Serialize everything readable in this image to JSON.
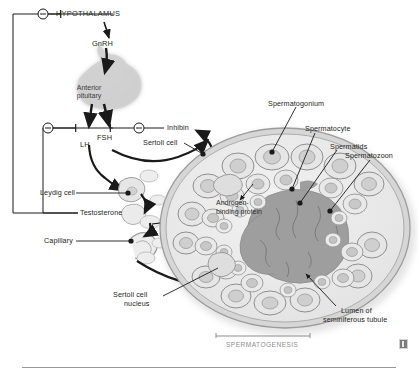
{
  "figure": {
    "title_region": "Hypothalamic-pituitary-testicular axis and seminiferous tubule histology",
    "bracket_label": "SPERMATOGENESIS"
  },
  "axis": {
    "hypothalamus": "HYPOTHALAMUS",
    "gnrh": "GnRH",
    "anterior_pituitary_line1": "Anterior",
    "anterior_pituitary_line2": "pituitary",
    "lh": "LH",
    "fsh": "FSH",
    "inhibin": "Inhibin",
    "feedback_sign": "–"
  },
  "left_labels": [
    {
      "name": "leydig-cell",
      "text": "Leydig cell"
    },
    {
      "name": "testosterone",
      "text": "Testosterone"
    },
    {
      "name": "capillary",
      "text": "Capillary"
    },
    {
      "name": "sertoli-cell-nucleus-line1",
      "text": "Sertoli cell"
    },
    {
      "name": "sertoli-cell-nucleus-line2",
      "text": "nucleus"
    }
  ],
  "tubule_labels": {
    "sertoli_cell": "Sertoli cell",
    "spermatogonium": "Spermatogonium",
    "spermatocyte": "Spermatocyte",
    "spermatids": "Spermatids",
    "spermatozoon": "Spermatozoon",
    "androgen_binding_line1": "Androgen-",
    "androgen_binding_line2": "binding protein",
    "lumen_line1": "Lumen of",
    "lumen_line2": "seminiferous tubule"
  },
  "colors": {
    "ink": "#231f20",
    "leader": "#1a1a1a",
    "pituitary": "#cfcfcf",
    "tubule_wall": "#b8b8b8",
    "tubule_fill": "#ececec",
    "cell_fill": "#e2e2e2",
    "cell_stroke": "#9a9a9a",
    "nucleus": "#c9c9c9",
    "lumen": "#9e9e9e",
    "caption_grey": "#8d8d8d",
    "rule": "#9a9a9a"
  }
}
